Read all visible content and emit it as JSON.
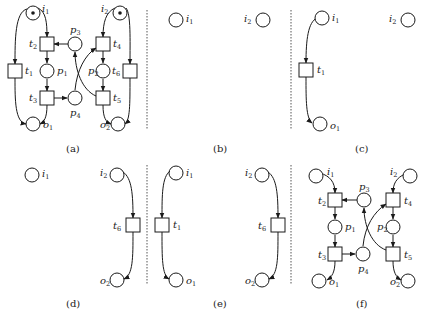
{
  "figure": {
    "captions": {
      "a": "(a)",
      "b": "(b)",
      "c": "(c)",
      "d": "(d)",
      "e": "(e)",
      "f": "(f)"
    },
    "labels": {
      "i": "i",
      "o": "o",
      "t": "t",
      "p": "p",
      "n1": "1",
      "n2": "2",
      "n3": "3",
      "n4": "4",
      "n5": "5",
      "n6": "6"
    },
    "panels": [
      {
        "id": "a",
        "description": "Full Petri net with tokens in i1 and i2",
        "places": [
          "i1",
          "i2",
          "p1",
          "p2",
          "p3",
          "p4",
          "o1",
          "o2"
        ],
        "transitions": [
          "t1",
          "t2",
          "t3",
          "t4",
          "t5",
          "t6"
        ],
        "marked": [
          "i1",
          "i2"
        ]
      },
      {
        "id": "b",
        "description": "Only input places",
        "places": [
          "i1",
          "i2"
        ],
        "transitions": []
      },
      {
        "id": "c",
        "description": "Fragment i1 -> t1 -> o1 plus i2",
        "places": [
          "i1",
          "o1",
          "i2"
        ],
        "transitions": [
          "t1"
        ]
      },
      {
        "id": "d",
        "description": "i1 plus fragment i2 -> t6 -> o2",
        "places": [
          "i1",
          "i2",
          "o2"
        ],
        "transitions": [
          "t6"
        ]
      },
      {
        "id": "e",
        "description": "Both fragments i2 -> t6 -> o2 and i1 -> t1 -> o1",
        "places": [
          "i1",
          "o1",
          "i2",
          "o2"
        ],
        "transitions": [
          "t1",
          "t6"
        ]
      },
      {
        "id": "f",
        "description": "Net without t1 and t6, no tokens",
        "places": [
          "i1",
          "i2",
          "p1",
          "p2",
          "p3",
          "p4",
          "o1",
          "o2"
        ],
        "transitions": [
          "t2",
          "t3",
          "t4",
          "t5"
        ]
      }
    ],
    "colors": {
      "stroke": "#1a1a1a",
      "separator": "#555555",
      "background": "#ffffff"
    }
  }
}
